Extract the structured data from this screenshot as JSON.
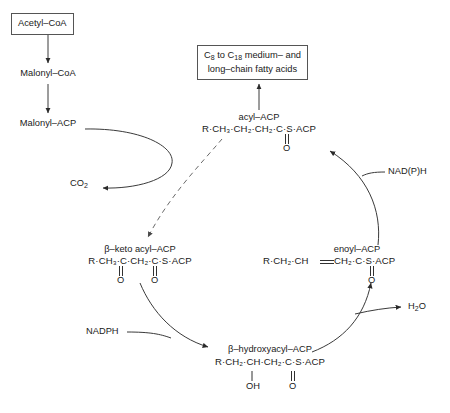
{
  "diagram": {
    "nodes": {
      "acetyl_coa": "Acetyl–CoA",
      "malonyl_coa": "Malonyl–CoA",
      "malonyl_acp": "Malonyl–ACP",
      "co2": "CO",
      "co2_sub": "2",
      "product_line1_a": "C",
      "product_line1_a_sub": "8",
      "product_line1_b": " to C",
      "product_line1_b_sub": "18",
      "product_line1_c": " medium– and",
      "product_line2": "long–chain fatty acids",
      "acyl_name": "acyl–ACP",
      "acyl_formula": "R·CH₃·CH₂·CH₂·C·S·ACP",
      "acyl_o": "O",
      "betaketo_name": "β–keto acyl–ACP",
      "betaketo_formula": "R·CH₃·C·CH₂·C·S·ACP",
      "betaketo_o1": "O",
      "betaketo_o2": "O",
      "enoyl_name": "enoyl–ACP",
      "enoyl_formula_left": "R·CH₂·CH",
      "enoyl_formula_right": "CH₂·C·S·ACP",
      "enoyl_o": "O",
      "betahydroxy_name": "β–hydroxyacyl–ACP",
      "betahydroxy_formula": "R·CH₂·CH·CH₂·C·S·ACP",
      "betahydroxy_oh": "OH",
      "betahydroxy_o": "O",
      "nadph": "NADPH",
      "nadph_oxidized": "NAD(P)H",
      "water": "H",
      "water_sub": "2",
      "water_suffix": "O"
    },
    "colors": {
      "stroke": "#3a3a3a",
      "text": "#1a1a1a",
      "box_border": "#555555",
      "background": "#ffffff"
    }
  }
}
